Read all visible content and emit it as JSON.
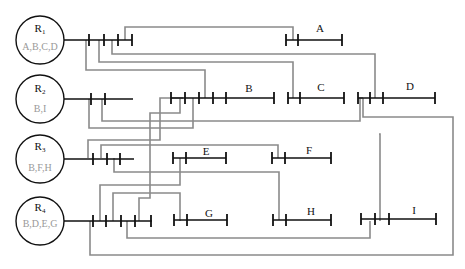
{
  "diagram": {
    "type": "resource-segment-connection-diagram",
    "resources": [
      {
        "id": "R1",
        "label": "R",
        "subscript": "1",
        "contents": "A,B,C,D"
      },
      {
        "id": "R2",
        "label": "R",
        "subscript": "2",
        "contents": "B,I"
      },
      {
        "id": "R3",
        "label": "R",
        "subscript": "3",
        "contents": "B,F,H"
      },
      {
        "id": "R4",
        "label": "R",
        "subscript": "4",
        "contents": "B,D,E,G"
      }
    ],
    "segments": [
      {
        "id": "A",
        "label": "A"
      },
      {
        "id": "B",
        "label": "B"
      },
      {
        "id": "C",
        "label": "C"
      },
      {
        "id": "D",
        "label": "D"
      },
      {
        "id": "E",
        "label": "E"
      },
      {
        "id": "F",
        "label": "F"
      },
      {
        "id": "G",
        "label": "G"
      },
      {
        "id": "H",
        "label": "H"
      },
      {
        "id": "I",
        "label": "I"
      }
    ],
    "colors": {
      "lines": "#111111",
      "connectors": "#8a8a8a",
      "contents_text": "#999999",
      "background": "#ffffff"
    }
  }
}
